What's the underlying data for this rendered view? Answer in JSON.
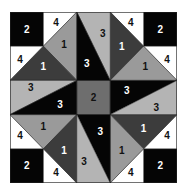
{
  "diagram": {
    "title": "",
    "grid": {
      "columns": 5,
      "rows": 5
    },
    "colors": {
      "1_dark": "#3c3c3c",
      "1_light": "#9a9a9a",
      "2_corner": "#050505",
      "2_center": "#6e6e6e",
      "3_dark": "#050505",
      "3_light": "#b4b4b4",
      "4": "#ffffff",
      "outline": "#222222",
      "text_on_dark": "#ffffff",
      "text_on_light": "#111111"
    },
    "pieces": [
      {
        "id": "corner-tl",
        "label": "2",
        "shade": "2_corner",
        "points": "0,0 1,0 1,1 0,1",
        "lx": 0.5,
        "ly": 0.5
      },
      {
        "id": "corner-tr",
        "label": "2",
        "shade": "2_corner",
        "points": "4,0 5,0 5,1 4,1",
        "lx": 4.5,
        "ly": 0.5
      },
      {
        "id": "corner-bl",
        "label": "2",
        "shade": "2_corner",
        "points": "0,4 1,4 1,5 0,5",
        "lx": 0.5,
        "ly": 4.5
      },
      {
        "id": "corner-br",
        "label": "2",
        "shade": "2_corner",
        "points": "4,4 5,4 5,5 4,5",
        "lx": 4.5,
        "ly": 4.5
      },
      {
        "id": "center",
        "label": "2",
        "shade": "2_center",
        "points": "2,2 3,2 3,3 2,3",
        "lx": 2.5,
        "ly": 2.5
      },
      {
        "id": "tl-white-top",
        "label": "4",
        "shade": "4",
        "points": "1,0 2,0 1,1",
        "lx": 1.38,
        "ly": 0.3
      },
      {
        "id": "tl-white-left",
        "label": "4",
        "shade": "4",
        "points": "0,1 1,1 0,2",
        "lx": 0.3,
        "ly": 1.38
      },
      {
        "id": "tl-light-1",
        "label": "1",
        "shade": "1_light",
        "points": "2,0 1,1 2,2",
        "lx": 1.62,
        "ly": 0.95
      },
      {
        "id": "tl-dark-1",
        "label": "1",
        "shade": "1_dark",
        "points": "1,1 0,2 2,2",
        "lx": 1.0,
        "ly": 1.6
      },
      {
        "id": "tr-white-top",
        "label": "4",
        "shade": "4",
        "points": "3,0 4,0 4,1",
        "lx": 3.62,
        "ly": 0.3
      },
      {
        "id": "tr-white-right",
        "label": "4",
        "shade": "4",
        "points": "4,1 5,1 5,2",
        "lx": 4.7,
        "ly": 1.38
      },
      {
        "id": "tr-dark-1",
        "label": "1",
        "shade": "1_dark",
        "points": "3,0 4,1 3,2",
        "lx": 3.35,
        "ly": 1.0
      },
      {
        "id": "tr-light-1",
        "label": "1",
        "shade": "1_light",
        "points": "4,1 5,2 3,2",
        "lx": 4.05,
        "ly": 1.6
      },
      {
        "id": "bl-white-left",
        "label": "4",
        "shade": "4",
        "points": "0,3 0,4 1,4",
        "lx": 0.3,
        "ly": 3.62
      },
      {
        "id": "bl-white-bottom",
        "label": "4",
        "shade": "4",
        "points": "1,4 1,5 2,5",
        "lx": 1.38,
        "ly": 4.7
      },
      {
        "id": "bl-light-1",
        "label": "1",
        "shade": "1_light",
        "points": "0,3 2,3 1,4",
        "lx": 1.0,
        "ly": 3.35
      },
      {
        "id": "bl-dark-1",
        "label": "1",
        "shade": "1_dark",
        "points": "2,3 1,4 2,5",
        "lx": 1.62,
        "ly": 4.05
      },
      {
        "id": "br-white-right",
        "label": "4",
        "shade": "4",
        "points": "5,3 5,4 4,4",
        "lx": 4.7,
        "ly": 3.62
      },
      {
        "id": "br-white-bottom",
        "label": "4",
        "shade": "4",
        "points": "4,4 4,5 3,5",
        "lx": 3.62,
        "ly": 4.7
      },
      {
        "id": "br-dark-1",
        "label": "1",
        "shade": "1_dark",
        "points": "5,3 3,3 4,4",
        "lx": 4.0,
        "ly": 3.4
      },
      {
        "id": "br-light-1",
        "label": "1",
        "shade": "1_light",
        "points": "3,3 4,4 3,5",
        "lx": 3.35,
        "ly": 4.05
      },
      {
        "id": "top-light-3",
        "label": "3",
        "shade": "3_light",
        "points": "2,0 3,0 3,2",
        "lx": 2.78,
        "ly": 0.62
      },
      {
        "id": "top-dark-3",
        "label": "3",
        "shade": "3_dark",
        "points": "2,0 2,2 3,2",
        "lx": 2.3,
        "ly": 1.5
      },
      {
        "id": "right-dark-3",
        "label": "3",
        "shade": "3_dark",
        "points": "5,2 3,2 3,3",
        "lx": 3.5,
        "ly": 2.3
      },
      {
        "id": "right-light-3",
        "label": "3",
        "shade": "3_light",
        "points": "5,2 5,3 3,3",
        "lx": 4.38,
        "ly": 2.78
      },
      {
        "id": "bottom-dark-3",
        "label": "3",
        "shade": "3_dark",
        "points": "3,5 3,3 2,3",
        "lx": 2.7,
        "ly": 3.5
      },
      {
        "id": "bottom-light-3",
        "label": "3",
        "shade": "3_light",
        "points": "3,5 2,5 2,3",
        "lx": 2.22,
        "ly": 4.38
      },
      {
        "id": "left-light-3",
        "label": "3",
        "shade": "3_light",
        "points": "0,3 0,2 2,2",
        "lx": 0.62,
        "ly": 2.22
      },
      {
        "id": "left-dark-3",
        "label": "3",
        "shade": "3_dark",
        "points": "0,3 2,3 2,2",
        "lx": 1.5,
        "ly": 2.7
      }
    ]
  }
}
